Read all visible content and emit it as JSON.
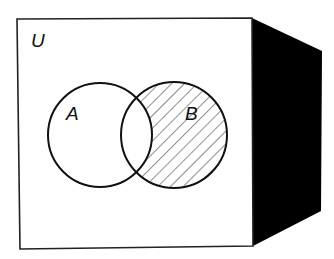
{
  "diagram": {
    "type": "venn",
    "universe_label": "U",
    "sets": [
      {
        "label": "A",
        "shaded": false
      },
      {
        "label": "B",
        "shaded": true
      }
    ],
    "shaded_region": "B minus A",
    "colors": {
      "background": "#ffffff",
      "stroke": "#111111",
      "side_face": "#000000",
      "hatch": "#333333"
    }
  }
}
